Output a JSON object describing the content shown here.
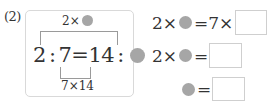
{
  "problem": {
    "number_label": "(2)",
    "diagram": {
      "top_annotation": {
        "prefix": "2×",
        "symbol": "gray-circle"
      },
      "equation": {
        "a": "2",
        "colon1": ":",
        "b": "7",
        "equals": "=",
        "c": "14",
        "colon2": ":",
        "d_symbol": "gray-circle"
      },
      "bottom_annotation": "7×14"
    },
    "work_rows": [
      {
        "left_prefix": "2×",
        "symbol": "gray-circle",
        "middle": "=7×",
        "answer": ""
      },
      {
        "left_prefix": "2×",
        "symbol": "gray-circle",
        "middle": "=",
        "answer": ""
      },
      {
        "left_prefix": "",
        "symbol": "gray-circle",
        "middle": "=",
        "answer": ""
      }
    ]
  },
  "colors": {
    "circle": "#a6a6a6",
    "box_border": "#d9d9d9",
    "text": "#333333"
  }
}
